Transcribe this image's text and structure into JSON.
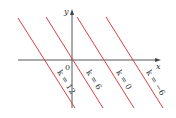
{
  "diagram": {
    "type": "level-curves",
    "axes": {
      "x_label": "x",
      "y_label": "y",
      "origin_label": "0"
    },
    "colors": {
      "line": "#d9414a",
      "axis": "#444444",
      "text": "#333333"
    },
    "lines": [
      {
        "label": "k = 12",
        "x1": 18,
        "y1": 18,
        "x2": 75,
        "y2": 108
      },
      {
        "label": "k = 6",
        "x1": 46,
        "y1": 17,
        "x2": 103,
        "y2": 108
      },
      {
        "label": "k = 0",
        "x1": 77,
        "y1": 17,
        "x2": 134,
        "y2": 108
      },
      {
        "label": "k = −6",
        "x1": 106,
        "y1": 17,
        "x2": 163,
        "y2": 108
      }
    ]
  }
}
